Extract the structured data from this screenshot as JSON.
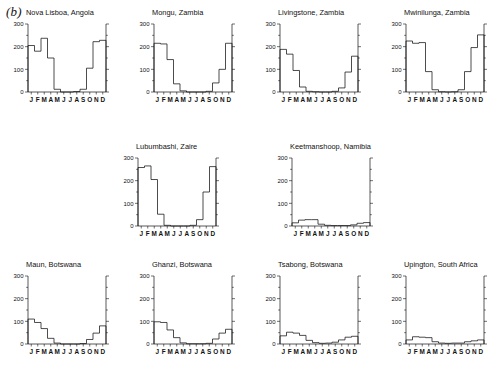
{
  "figure": {
    "panel_label": "(b)",
    "months": [
      "J",
      "F",
      "M",
      "A",
      "M",
      "J",
      "J",
      "A",
      "S",
      "O",
      "N",
      "D"
    ],
    "y_ticks": [
      0,
      100,
      200,
      300
    ],
    "y_min": 0,
    "y_max": 300,
    "line_color": "#111111",
    "background": "#ffffff"
  },
  "chart_data": [
    {
      "type": "line",
      "title": "Nova Lisboa, Angola",
      "xlabel": "",
      "ylabel": "",
      "ylim": [
        0,
        300
      ],
      "grid": false,
      "categories": [
        "J",
        "F",
        "M",
        "A",
        "M",
        "J",
        "J",
        "A",
        "S",
        "O",
        "N",
        "D"
      ],
      "values": [
        205,
        180,
        237,
        150,
        12,
        0,
        0,
        2,
        12,
        105,
        222,
        228
      ]
    },
    {
      "type": "line",
      "title": "Mongu, Zambia",
      "xlabel": "",
      "ylabel": "",
      "ylim": [
        0,
        300
      ],
      "grid": false,
      "categories": [
        "J",
        "F",
        "M",
        "A",
        "M",
        "J",
        "J",
        "A",
        "S",
        "O",
        "N",
        "D"
      ],
      "values": [
        215,
        212,
        143,
        36,
        5,
        0,
        0,
        0,
        3,
        40,
        100,
        215
      ]
    },
    {
      "type": "line",
      "title": "Livingstone, Zambia",
      "xlabel": "",
      "ylabel": "",
      "ylim": [
        0,
        300
      ],
      "grid": false,
      "categories": [
        "J",
        "F",
        "M",
        "A",
        "M",
        "J",
        "J",
        "A",
        "S",
        "O",
        "N",
        "D"
      ],
      "values": [
        188,
        167,
        95,
        22,
        3,
        1,
        0,
        0,
        3,
        18,
        88,
        158
      ]
    },
    {
      "type": "line",
      "title": "Mwinilunga, Zambia",
      "xlabel": "",
      "ylabel": "",
      "ylim": [
        0,
        300
      ],
      "grid": false,
      "categories": [
        "J",
        "F",
        "M",
        "A",
        "M",
        "J",
        "J",
        "A",
        "S",
        "O",
        "N",
        "D"
      ],
      "values": [
        225,
        215,
        218,
        90,
        10,
        1,
        0,
        1,
        10,
        90,
        196,
        252
      ]
    },
    {
      "type": "line",
      "title": "Lubumbashi, Zaire",
      "xlabel": "",
      "ylabel": "",
      "ylim": [
        0,
        300
      ],
      "grid": false,
      "categories": [
        "J",
        "F",
        "M",
        "A",
        "M",
        "J",
        "J",
        "A",
        "S",
        "O",
        "N",
        "D"
      ],
      "values": [
        258,
        265,
        205,
        52,
        3,
        0,
        0,
        0,
        3,
        28,
        150,
        262
      ]
    },
    {
      "type": "line",
      "title": "Keetmanshoop, Namibia",
      "xlabel": "",
      "ylabel": "",
      "ylim": [
        0,
        300
      ],
      "grid": false,
      "categories": [
        "J",
        "F",
        "M",
        "A",
        "M",
        "J",
        "J",
        "A",
        "S",
        "O",
        "N",
        "D"
      ],
      "values": [
        14,
        26,
        28,
        28,
        8,
        3,
        2,
        2,
        2,
        5,
        12,
        15
      ]
    },
    {
      "type": "line",
      "title": "Maun, Botswana",
      "xlabel": "",
      "ylabel": "",
      "ylim": [
        0,
        300
      ],
      "grid": false,
      "categories": [
        "J",
        "F",
        "M",
        "A",
        "M",
        "J",
        "J",
        "A",
        "S",
        "O",
        "N",
        "D"
      ],
      "values": [
        110,
        95,
        68,
        25,
        4,
        0,
        0,
        0,
        2,
        20,
        48,
        80
      ]
    },
    {
      "type": "line",
      "title": "Ghanzi, Botswana",
      "xlabel": "",
      "ylabel": "",
      "ylim": [
        0,
        300
      ],
      "grid": false,
      "categories": [
        "J",
        "F",
        "M",
        "A",
        "M",
        "J",
        "J",
        "A",
        "S",
        "O",
        "N",
        "D"
      ],
      "values": [
        98,
        95,
        62,
        28,
        5,
        1,
        1,
        1,
        3,
        22,
        48,
        65
      ]
    },
    {
      "type": "line",
      "title": "Tsabong, Botswana",
      "xlabel": "",
      "ylabel": "",
      "ylim": [
        0,
        300
      ],
      "grid": false,
      "categories": [
        "J",
        "F",
        "M",
        "A",
        "M",
        "J",
        "J",
        "A",
        "S",
        "O",
        "N",
        "D"
      ],
      "values": [
        36,
        52,
        48,
        38,
        16,
        6,
        3,
        4,
        8,
        18,
        30,
        34
      ]
    },
    {
      "type": "line",
      "title": "Upington, South Africa",
      "xlabel": "",
      "ylabel": "",
      "ylim": [
        0,
        300
      ],
      "grid": false,
      "categories": [
        "J",
        "F",
        "M",
        "A",
        "M",
        "J",
        "J",
        "A",
        "S",
        "O",
        "N",
        "D"
      ],
      "values": [
        18,
        32,
        30,
        28,
        10,
        4,
        3,
        4,
        4,
        10,
        14,
        18
      ]
    }
  ]
}
